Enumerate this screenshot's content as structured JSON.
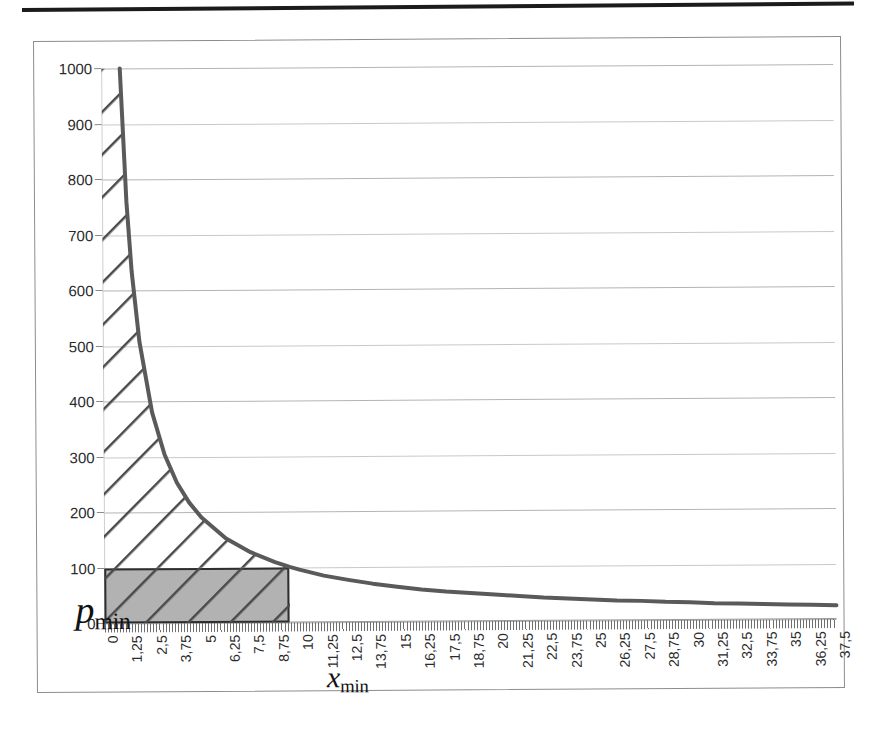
{
  "page": {
    "background_color": "#ffffff",
    "rule_color": "#1b1b1b"
  },
  "chart": {
    "frame_color": "#8d8d8d",
    "plot_background": "#ffffff",
    "gridline_color": "#c9c9c9",
    "axis_color": "#9a9a9a",
    "curve_color": "#5a5a5a",
    "hatch_color": "#4a4a4a",
    "rect_fill_color": "#b2b2b2",
    "rect_border_color": "#2e2e2e"
  },
  "annotations": {
    "p_min": {
      "symbol": "p",
      "subscript": "min"
    },
    "x_min": {
      "symbol": "x",
      "subscript": "min"
    }
  },
  "chart_data": {
    "type": "line",
    "title": "",
    "subtitle": "",
    "xlabel": "",
    "ylabel": "",
    "xlim": [
      0,
      37.5
    ],
    "ylim": [
      0,
      1000
    ],
    "grid": true,
    "legend": false,
    "decimal_separator": ",",
    "curve": {
      "name": "p(x) = k/x",
      "k": 950,
      "x": [
        0.95,
        1.25,
        1.5,
        1.875,
        2.5,
        3.125,
        3.75,
        4.375,
        5,
        6.25,
        7.5,
        8.75,
        9.5,
        10,
        11.25,
        12.5,
        13.75,
        15,
        16.25,
        17.5,
        18.75,
        20,
        21.25,
        22.5,
        23.75,
        25,
        26.25,
        27.5,
        28.75,
        30,
        31.25,
        32.5,
        33.75,
        35,
        36.25,
        37.5
      ],
      "y": [
        1000,
        760,
        633,
        507,
        380,
        304,
        253,
        217,
        190,
        152,
        127,
        109,
        100,
        95,
        84,
        76,
        69,
        63,
        58,
        54,
        51,
        48,
        45,
        42,
        40,
        38,
        36,
        35,
        33,
        32,
        30,
        29,
        28,
        27,
        26,
        25
      ]
    },
    "shaded_rectangle": {
      "label": "p_min x_min",
      "x_from": 0,
      "x_to": 9.5,
      "y_from": 0,
      "y_to": 100,
      "fill": "#b2b2b2",
      "hatched": true
    },
    "hatched_region": {
      "label": "area between curve and p_min line",
      "hatch_angle_deg": 45,
      "x_from": 0,
      "x_to": 9.5,
      "y_from": 100,
      "y_to": 1000
    },
    "yticks": [
      0,
      100,
      200,
      300,
      400,
      500,
      600,
      700,
      800,
      900,
      1000
    ],
    "ytick_labels": [
      "0",
      "100",
      "200",
      "300",
      "400",
      "500",
      "600",
      "700",
      "800",
      "900",
      "1000"
    ],
    "xticks": [
      0,
      1.25,
      2.5,
      3.75,
      5,
      6.25,
      7.5,
      8.75,
      10,
      11.25,
      12.5,
      13.75,
      15,
      16.25,
      17.5,
      18.75,
      20,
      21.25,
      22.5,
      23.75,
      25,
      26.25,
      27.5,
      28.75,
      30,
      31.25,
      32.5,
      33.75,
      35,
      36.25,
      37.5
    ],
    "xtick_labels": [
      "0",
      "1,25",
      "2,5",
      "3,75",
      "5",
      "6,25",
      "7,5",
      "8,75",
      "10",
      "11,25",
      "12,5",
      "13,75",
      "15",
      "16,25",
      "17,5",
      "18,75",
      "20",
      "21,25",
      "22,5",
      "23,75",
      "25",
      "26,25",
      "27,5",
      "28,75",
      "30",
      "31,25",
      "32,5",
      "33,75",
      "35",
      "36,25",
      "37,5"
    ]
  }
}
